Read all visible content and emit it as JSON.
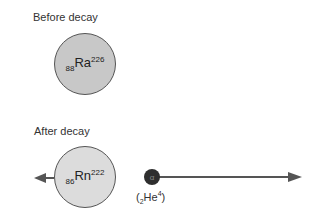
{
  "before": {
    "label": "Before decay",
    "nucleus": {
      "z": "88",
      "symbol": "Ra",
      "a": "226",
      "fill": "#c8c8c8"
    }
  },
  "after": {
    "label": "After decay",
    "nucleus": {
      "z": "86",
      "symbol": "Rn",
      "a": "222",
      "fill": "#dcdcdc"
    },
    "alpha": {
      "glyph": "α",
      "open": "(",
      "z": "2",
      "symbol": "He",
      "a": "4",
      "close": ")",
      "fill": "#2e2e2e"
    }
  }
}
